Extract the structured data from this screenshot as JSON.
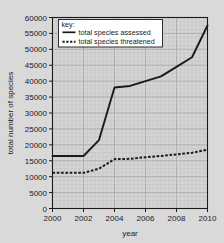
{
  "chart_data": {
    "type": "line",
    "title": "",
    "xlabel": "year",
    "ylabel": "total number of species",
    "xlim": [
      2000,
      2010
    ],
    "ylim": [
      0,
      60000
    ],
    "grid": true,
    "legend_position": "top-left",
    "legend_title": "key:",
    "xticks": [
      "2000",
      "2002",
      "2004",
      "2006",
      "2008",
      "2010"
    ],
    "xtick_values": [
      2000,
      2002,
      2004,
      2006,
      2008,
      2010
    ],
    "yticks": [
      "0",
      "5000",
      "10000",
      "15000",
      "20000",
      "25000",
      "30000",
      "35000",
      "40000",
      "45000",
      "50000",
      "55000",
      "60000"
    ],
    "ytick_values": [
      0,
      5000,
      10000,
      15000,
      20000,
      25000,
      30000,
      35000,
      40000,
      45000,
      50000,
      55000,
      60000
    ],
    "x": [
      2000,
      2001,
      2002,
      2003,
      2004,
      2005,
      2006,
      2007,
      2008,
      2009,
      2010
    ],
    "series": [
      {
        "name": "total species assessed",
        "style": "solid",
        "color": "#1a1a1a",
        "values": [
          16500,
          16500,
          16500,
          21500,
          38000,
          38500,
          40000,
          41500,
          44500,
          47500,
          57500
        ]
      },
      {
        "name": "total species threatened",
        "style": "dotted",
        "color": "#1a1a1a",
        "values": [
          11200,
          11200,
          11200,
          12500,
          15500,
          15600,
          16100,
          16500,
          17000,
          17500,
          18500
        ]
      }
    ]
  },
  "legend": {
    "title": "key:",
    "entries": [
      {
        "label": "total species assessed",
        "style": "solid"
      },
      {
        "label": "total species threatened",
        "style": "dotted"
      }
    ]
  },
  "colors": {
    "background": "#d9d9d9",
    "plot_background": "#d4d4d4",
    "grid_minor": "#c2c2c2",
    "grid_major": "#aaaaaa",
    "axis": "#1a1a1a",
    "line": "#1a1a1a",
    "legend_background": "#ffffff"
  }
}
